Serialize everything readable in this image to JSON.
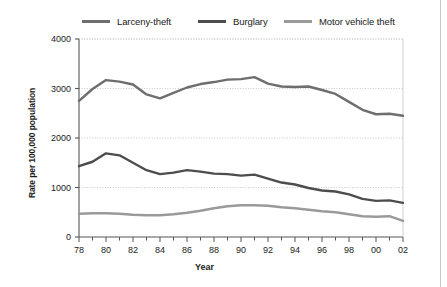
{
  "chart_data": {
    "type": "line",
    "title": "",
    "xlabel": "Year",
    "ylabel": "Rate per 100,000 population",
    "categories": [
      "78",
      "79",
      "80",
      "81",
      "82",
      "83",
      "84",
      "85",
      "86",
      "87",
      "88",
      "89",
      "90",
      "91",
      "92",
      "93",
      "94",
      "95",
      "96",
      "97",
      "98",
      "99",
      "00",
      "01",
      "02"
    ],
    "x_tick_labels": [
      "78",
      "80",
      "82",
      "84",
      "86",
      "88",
      "90",
      "92",
      "94",
      "96",
      "98",
      "00",
      "02"
    ],
    "y_tick_labels": [
      "0",
      "1000",
      "2000",
      "3000",
      "4000"
    ],
    "y_tick_values": [
      0,
      1000,
      2000,
      3000,
      4000
    ],
    "ylim": [
      0,
      4000
    ],
    "grid": true,
    "grid_axis": "y",
    "legend_position": "top",
    "series": [
      {
        "name": "Larceny-theft",
        "color": "#6e6e6e",
        "values": [
          2750,
          2990,
          3170,
          3140,
          3080,
          2880,
          2800,
          2910,
          3020,
          3090,
          3130,
          3180,
          3190,
          3230,
          3100,
          3040,
          3030,
          3040,
          2970,
          2890,
          2730,
          2570,
          2480,
          2490,
          2450
        ]
      },
      {
        "name": "Burglary",
        "color": "#4d4d4d",
        "values": [
          1430,
          1520,
          1690,
          1650,
          1500,
          1350,
          1270,
          1300,
          1350,
          1320,
          1280,
          1270,
          1240,
          1260,
          1180,
          1100,
          1060,
          990,
          940,
          920,
          860,
          770,
          730,
          740,
          690
        ]
      },
      {
        "name": "Motor vehicle theft",
        "color": "#9a9a9a",
        "values": [
          470,
          480,
          480,
          470,
          450,
          440,
          440,
          460,
          490,
          530,
          580,
          620,
          640,
          640,
          630,
          600,
          580,
          550,
          520,
          500,
          460,
          420,
          410,
          420,
          325
        ]
      }
    ]
  },
  "legend": {
    "items": [
      {
        "label": "Larceny-theft",
        "color": "#6e6e6e"
      },
      {
        "label": "Burglary",
        "color": "#4d4d4d"
      },
      {
        "label": "Motor vehicle theft",
        "color": "#9a9a9a"
      }
    ]
  },
  "axes": {
    "y_label": "Rate per 100,000 population",
    "x_label": "Year"
  }
}
